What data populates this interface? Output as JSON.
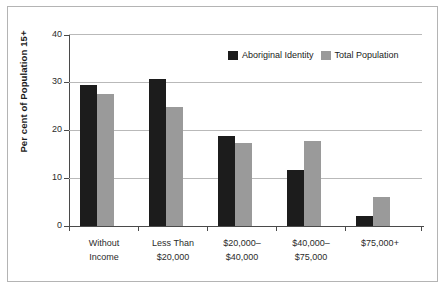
{
  "chart_data": {
    "type": "bar",
    "title": "",
    "xlabel": "",
    "ylabel": "Per cent of Population 15+",
    "ylim": [
      0,
      40
    ],
    "yticks": [
      0,
      10,
      20,
      30,
      40
    ],
    "ytick_labels": [
      "0",
      "10",
      "20",
      "30",
      "40"
    ],
    "grid": true,
    "legend_position": "top-right",
    "categories": [
      "Without\nIncome",
      "Less Than\n$20,000",
      "$20,000–\n$40,000",
      "$40,000–\n$75,000",
      "$75,000+"
    ],
    "category_lines": [
      [
        "Without",
        "Income"
      ],
      [
        "Less Than",
        "$20,000"
      ],
      [
        "$20,000–",
        "$40,000"
      ],
      [
        "$40,000–",
        "$75,000"
      ],
      [
        "$75,000+",
        ""
      ]
    ],
    "series": [
      {
        "name": "Aboriginal Identity",
        "color": "#1c1c1c",
        "values": [
          29.4,
          30.6,
          18.8,
          11.6,
          2.1
        ]
      },
      {
        "name": "Total Population",
        "color": "#9a9a9a",
        "values": [
          27.4,
          24.8,
          17.2,
          17.7,
          6.0
        ]
      }
    ]
  },
  "legend": {
    "items": [
      {
        "label": "Aboriginal Identity",
        "swatch": "black"
      },
      {
        "label": "Total Population",
        "swatch": "gray"
      }
    ]
  },
  "axis": {
    "y_title": "Per cent of Population 15+",
    "y_labels": [
      "40",
      "30",
      "20",
      "10",
      "0"
    ]
  },
  "colors": {
    "series_aboriginal": "#1c1c1c",
    "series_total": "#9a9a9a",
    "gridline": "#b9b9b9",
    "axis": "#4a4a4a",
    "frame": "#b4b4b4",
    "background": "#ffffff"
  }
}
